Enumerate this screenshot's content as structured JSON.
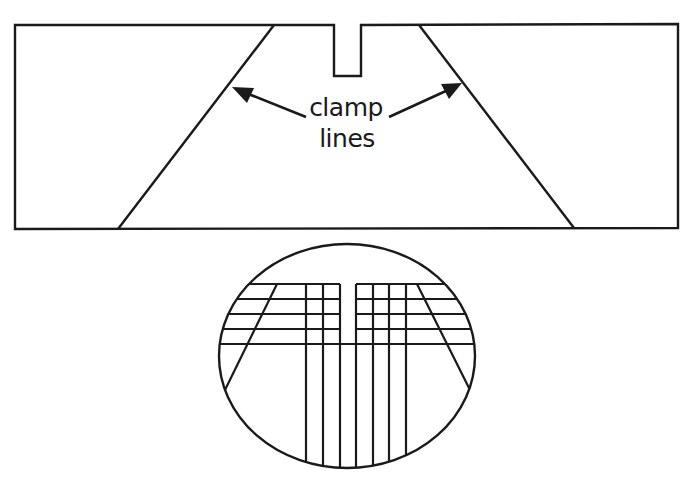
{
  "figure": {
    "type": "technical-diagram",
    "description_visible": "board outline with notch and two clamp lines; magnified circular inset showing grid of cut lines",
    "stroke_color": "#1a1a1a",
    "background_color": "#ffffff"
  },
  "board": {
    "outline": {
      "x1": 15,
      "y1": 25,
      "x2": 678,
      "y2": 229
    },
    "notch": {
      "left": 334,
      "right": 361,
      "bottom": 76
    },
    "clamp_lines": [
      {
        "name": "left",
        "top": [
          274,
          25
        ],
        "bottom": [
          118,
          229
        ]
      },
      {
        "name": "right",
        "top": [
          419,
          25
        ],
        "bottom": [
          574,
          229
        ]
      }
    ]
  },
  "annotation": {
    "line1": "clamp",
    "line2": "lines",
    "arrows": [
      {
        "name": "left",
        "tail": [
          306,
          117
        ],
        "tip": [
          232,
          87
        ]
      },
      {
        "name": "right",
        "tail": [
          389,
          117
        ],
        "tip": [
          462,
          84
        ]
      }
    ]
  },
  "inset": {
    "ellipse": {
      "cx": 347,
      "cy": 356,
      "rx": 129,
      "ry": 113
    },
    "horizontal_lines_y": [
      284,
      299,
      314,
      329,
      344
    ],
    "vertical_lines_x": [
      306,
      323,
      340,
      356,
      373,
      389,
      406
    ],
    "center_slot": {
      "left": 340,
      "right": 356,
      "bottom": 344
    },
    "slant_lines": [
      {
        "name": "left",
        "top": [
          277,
          284
        ],
        "bottom": [
          225,
          390
        ]
      },
      {
        "name": "right",
        "top": [
          417,
          284
        ],
        "bottom": [
          469,
          388
        ]
      }
    ]
  }
}
